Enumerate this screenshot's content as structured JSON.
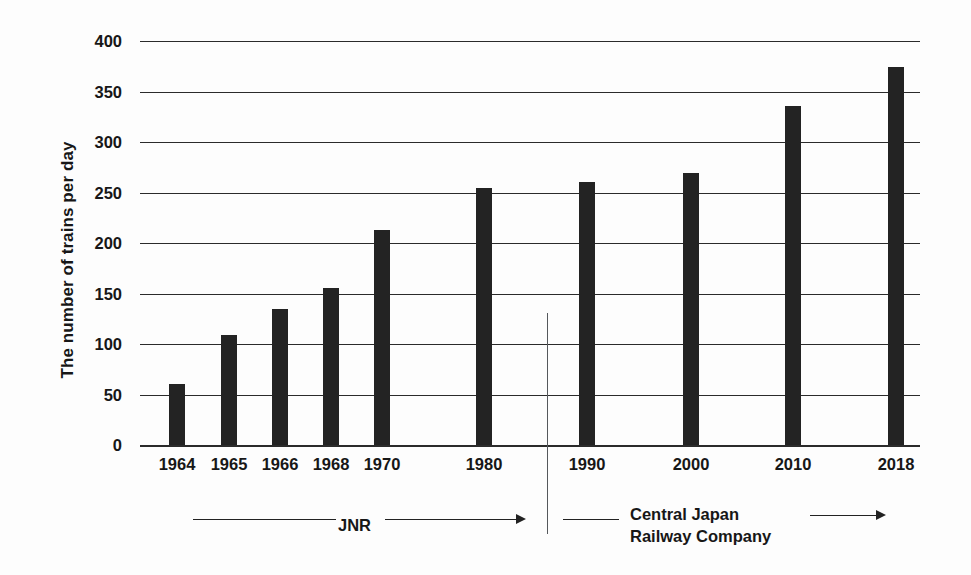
{
  "chart_data": {
    "type": "bar",
    "title": "",
    "xlabel": "",
    "ylabel": "The number of trains per day",
    "categories": [
      "1964",
      "1965",
      "1966",
      "1968",
      "1970",
      "1980",
      "1990",
      "2000",
      "2010",
      "2018"
    ],
    "values": [
      60,
      109,
      135,
      155,
      213,
      254,
      260,
      269,
      336,
      374
    ],
    "ylim": [
      0,
      400
    ],
    "ytick_step": 50,
    "yticks": [
      "400",
      "350",
      "300",
      "250",
      "200",
      "150",
      "100",
      "50",
      "0"
    ],
    "grid": true,
    "legend": false,
    "bar_color": "#232323",
    "annotations": [
      {
        "id": "jnr",
        "label": "JNR",
        "arrow": "right",
        "span_categories": [
          "1964",
          "1980"
        ]
      },
      {
        "id": "cjr",
        "label": "Central Japan\nRailway Company",
        "label_line1": "Central Japan",
        "label_line2": "Railway Company",
        "arrow": "right",
        "span_categories": [
          "1990",
          "2018"
        ]
      }
    ],
    "divider": {
      "label": "",
      "between_categories": [
        "1980",
        "1990"
      ]
    }
  },
  "axis": {
    "y_title": "The number of trains per day",
    "ticks": [
      {
        "value": 400,
        "label": "400"
      },
      {
        "value": 350,
        "label": "350"
      },
      {
        "value": 300,
        "label": "300"
      },
      {
        "value": 250,
        "label": "250"
      },
      {
        "value": 200,
        "label": "200"
      },
      {
        "value": 150,
        "label": "150"
      },
      {
        "value": 100,
        "label": "100"
      },
      {
        "value": 50,
        "label": "50"
      },
      {
        "value": 0,
        "label": "0"
      }
    ]
  },
  "bars": [
    {
      "label": "1964",
      "value": 60
    },
    {
      "label": "1965",
      "value": 109
    },
    {
      "label": "1966",
      "value": 135
    },
    {
      "label": "1968",
      "value": 155
    },
    {
      "label": "1970",
      "value": 213
    },
    {
      "label": "1980",
      "value": 254
    },
    {
      "label": "1990",
      "value": 260
    },
    {
      "label": "2000",
      "value": 269
    },
    {
      "label": "2010",
      "value": 336
    },
    {
      "label": "2018",
      "value": 374
    }
  ],
  "annotations": {
    "jnr_label": "JNR",
    "cjr_label_line1": "Central Japan",
    "cjr_label_line2": "Railway Company"
  },
  "colors": {
    "bar": "#232323",
    "grid": "#2b2b2b",
    "text": "#171717",
    "divider": "#55585c",
    "background": "#fdfdfd"
  }
}
